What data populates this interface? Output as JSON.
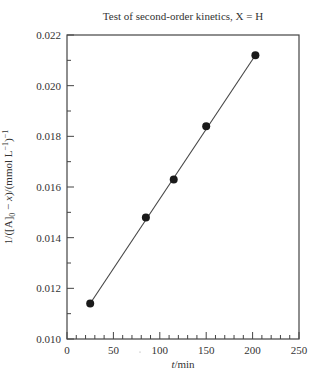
{
  "chart_data": {
    "type": "scatter",
    "title": "Test of second-order kinetics, X = H",
    "xlabel": "t/min",
    "ylabel": "1/([A]0 − x)/(mmol L−1)−1",
    "xlim": [
      0,
      250
    ],
    "ylim": [
      0.01,
      0.022
    ],
    "x_ticks": [
      0,
      50,
      100,
      150,
      200,
      250
    ],
    "x_tick_labels": [
      "0",
      "50",
      "100",
      "150",
      "200",
      "250"
    ],
    "x_minor_step": 10,
    "y_ticks": [
      0.01,
      0.012,
      0.014,
      0.016,
      0.018,
      0.02,
      0.022
    ],
    "y_tick_labels": [
      "0.010",
      "0.012",
      "0.014",
      "0.016",
      "0.018",
      "0.020",
      "0.022"
    ],
    "y_minor_step": 0.001,
    "grid": false,
    "legend": null,
    "series": [
      {
        "name": "data",
        "marker": "filled-circle",
        "color": "#1a1a1a",
        "x": [
          25,
          85,
          115,
          150,
          203
        ],
        "y": [
          0.0114,
          0.0148,
          0.0163,
          0.0184,
          0.0212
        ]
      }
    ],
    "fit_line": {
      "type": "linear",
      "color": "#444444",
      "x": [
        25,
        203
      ],
      "y": [
        0.0114,
        0.0212
      ]
    }
  },
  "labels": {
    "title": "Test of second-order kinetics, X = H",
    "xlabel_italic": "t",
    "xlabel_rest": "/min",
    "ylabel_prefix": "1/([A]",
    "ylabel_sub": "0",
    "ylabel_mid": " − ",
    "ylabel_x": "x",
    "ylabel_unit": ")/(mmol L",
    "ylabel_sup1": "−1",
    "ylabel_close": ")",
    "ylabel_sup2": "−1"
  }
}
